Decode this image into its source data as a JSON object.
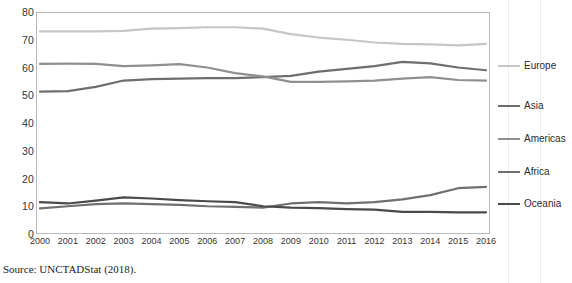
{
  "source_note": "Source: UNCTADStat (2018).",
  "top_partial_text": "",
  "chart_data": {
    "type": "line",
    "title": "",
    "subtitle": "",
    "xlabel": "",
    "ylabel": "",
    "x": [
      2000,
      2001,
      2002,
      2003,
      2004,
      2005,
      2006,
      2007,
      2008,
      2009,
      2010,
      2011,
      2012,
      2013,
      2014,
      2015,
      2016
    ],
    "categories": [
      "2000",
      "2001",
      "2002",
      "2003",
      "2004",
      "2005",
      "2006",
      "2007",
      "2008",
      "2009",
      "2010",
      "2011",
      "2012",
      "2013",
      "2014",
      "2015",
      "2016"
    ],
    "ylim": [
      0,
      80
    ],
    "yticks": [
      0,
      10,
      20,
      30,
      40,
      50,
      60,
      70,
      80
    ],
    "ytick_labels": [
      "0",
      "10",
      "20",
      "30",
      "40",
      "50",
      "60",
      "70",
      "80"
    ],
    "grid": false,
    "legend_position": "right",
    "series": [
      {
        "name": "Europe",
        "color": "#c6c6c6",
        "values": [
          73.0,
          73.0,
          73.0,
          73.2,
          74.0,
          74.2,
          74.5,
          74.5,
          74.0,
          72.0,
          70.8,
          70.0,
          69.0,
          68.5,
          68.3,
          68.0,
          68.5
        ]
      },
      {
        "name": "Asia",
        "color": "#6e6e6e",
        "values": [
          51.3,
          51.5,
          53.0,
          55.3,
          55.8,
          56.0,
          56.2,
          56.2,
          56.5,
          57.0,
          58.5,
          59.5,
          60.5,
          62.0,
          61.5,
          60.0,
          59.0
        ]
      },
      {
        "name": "Americas",
        "color": "#8f8f8f",
        "values": [
          61.3,
          61.4,
          61.3,
          60.5,
          60.8,
          61.2,
          60.0,
          58.0,
          56.8,
          54.8,
          54.8,
          55.0,
          55.3,
          56.0,
          56.5,
          55.5,
          55.3
        ]
      },
      {
        "name": "Africa",
        "color": "#707070",
        "values": [
          9.2,
          10.0,
          10.8,
          11.0,
          10.8,
          10.5,
          10.0,
          9.8,
          9.5,
          11.0,
          11.5,
          11.0,
          11.5,
          12.5,
          14.0,
          16.5,
          17.0
        ]
      },
      {
        "name": "Oceania",
        "color": "#4a4a4a",
        "values": [
          11.5,
          11.0,
          12.0,
          13.2,
          12.8,
          12.2,
          11.8,
          11.5,
          10.0,
          9.5,
          9.3,
          9.0,
          8.8,
          8.0,
          8.0,
          7.8,
          7.8
        ]
      }
    ]
  }
}
